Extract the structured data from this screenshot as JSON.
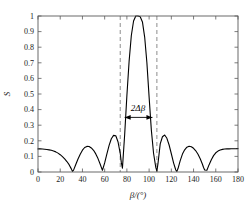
{
  "chart_data": {
    "type": "line",
    "title": "",
    "xlabel": "β/(°)",
    "ylabel": "S",
    "xlim": [
      0,
      180
    ],
    "ylim": [
      0,
      1
    ],
    "xticks": [
      0,
      20,
      40,
      60,
      80,
      100,
      120,
      140,
      160,
      180
    ],
    "xtick_labels": [
      "0",
      "20",
      "40",
      "60",
      "80",
      "100",
      "120",
      "140",
      "160",
      "180"
    ],
    "yticks": [
      0,
      0.1,
      0.2,
      0.3,
      0.4,
      0.5,
      0.6,
      0.7,
      0.8,
      0.9,
      1
    ],
    "ytick_labels": [
      "0",
      "0.1",
      "0.2",
      "0.3",
      "0.4",
      "0.5",
      "0.6",
      "0.7",
      "0.8",
      "0.9",
      "1"
    ],
    "grid": false,
    "legend": null,
    "series": [
      {
        "name": "S",
        "color": "#000000",
        "line_width": 1.1,
        "x": [
          0,
          2,
          4,
          6,
          8,
          10,
          12,
          14,
          16,
          18,
          20,
          22,
          24,
          26,
          28,
          30,
          31,
          32,
          34,
          36,
          38,
          40,
          42,
          44,
          46,
          48,
          50,
          52,
          54,
          56,
          57,
          58,
          60,
          62,
          64,
          66,
          68,
          70,
          72,
          74,
          75,
          76,
          78,
          80,
          82,
          84,
          86,
          88,
          90,
          92,
          94,
          96,
          98,
          100,
          102,
          104,
          106,
          107,
          108,
          110,
          112,
          114,
          116,
          118,
          120,
          122,
          124,
          125,
          126,
          128,
          130,
          132,
          134,
          136,
          138,
          140,
          142,
          144,
          146,
          148,
          149,
          150,
          152,
          154,
          156,
          158,
          160,
          162,
          164,
          166,
          168,
          170,
          172,
          174,
          176,
          178,
          180
        ],
        "y": [
          0.148,
          0.148,
          0.147,
          0.146,
          0.144,
          0.142,
          0.139,
          0.135,
          0.129,
          0.121,
          0.111,
          0.099,
          0.084,
          0.067,
          0.047,
          0.02,
          0.004,
          0.012,
          0.048,
          0.083,
          0.114,
          0.14,
          0.157,
          0.164,
          0.163,
          0.154,
          0.139,
          0.116,
          0.086,
          0.05,
          0.03,
          0.011,
          0.058,
          0.116,
          0.171,
          0.213,
          0.235,
          0.232,
          0.194,
          0.12,
          0.06,
          0.025,
          0.24,
          0.49,
          0.71,
          0.875,
          0.968,
          1.0,
          1.0,
          0.995,
          0.962,
          0.865,
          0.7,
          0.48,
          0.27,
          0.12,
          0.03,
          0.005,
          0.055,
          0.18,
          0.226,
          0.237,
          0.216,
          0.173,
          0.117,
          0.059,
          0.013,
          0.004,
          0.022,
          0.073,
          0.115,
          0.142,
          0.159,
          0.165,
          0.162,
          0.152,
          0.136,
          0.114,
          0.085,
          0.05,
          0.029,
          0.013,
          0.011,
          0.047,
          0.079,
          0.105,
          0.123,
          0.134,
          0.141,
          0.145,
          0.147,
          0.148,
          0.148,
          0.149,
          0.149,
          0.149,
          0.15
        ]
      }
    ],
    "reference_lines": [
      {
        "name": "left-null-line",
        "axis": "x",
        "value": 74,
        "style": "dashed",
        "color": "#808080"
      },
      {
        "name": "right-null-line",
        "axis": "x",
        "value": 107,
        "style": "dashed",
        "color": "#808080"
      }
    ],
    "annotations": [
      {
        "name": "beamwidth-annotation",
        "text": "2Δβ",
        "arrow": "double-headed",
        "x_start": 78,
        "x_end": 103,
        "y": 0.35,
        "label_x": 90,
        "label_y": 0.4
      }
    ]
  },
  "axes": {
    "y_axis_title": "S",
    "x_axis_title": "β/(°)"
  },
  "annotation": {
    "beamwidth_label": "2Δβ"
  }
}
